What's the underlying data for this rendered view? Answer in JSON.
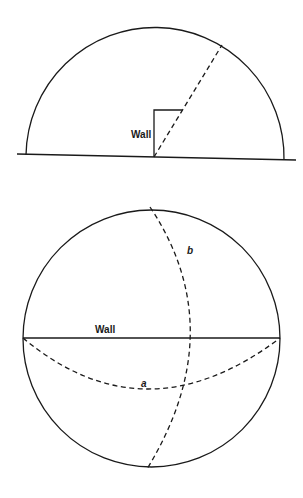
{
  "top_figure": {
    "description": "Hemisphere view with wall and sightline",
    "wall_label": "Wall"
  },
  "bottom_figure": {
    "description": "Sphere view (top-down) with wall diameter and two dashed great-circle arcs",
    "wall_label": "Wall",
    "arc_a_label": "a",
    "arc_b_label": "b"
  },
  "colors": {
    "line": "#1a1a1a",
    "background": "#ffffff"
  }
}
